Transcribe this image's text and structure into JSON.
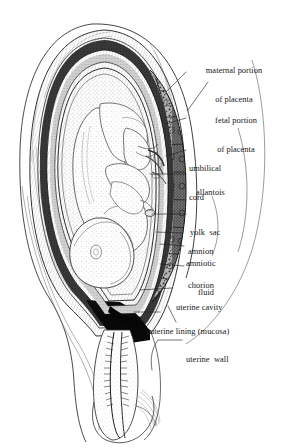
{
  "figure": {
    "background_color": "#ffffff",
    "ink_color": "#161616",
    "style": "stipple engraving, grayscale"
  },
  "labels": [
    {
      "id": "maternal-portion-of-placenta",
      "line1": "maternal portion",
      "line2": "of placenta"
    },
    {
      "id": "fetal-portion-of-placenta",
      "line1": "fetal portion",
      "line2": "of placenta"
    },
    {
      "id": "umbilical-cord",
      "line1": "umbilical",
      "line2": "cord"
    },
    {
      "id": "allantois",
      "line1": "allantois",
      "line2": ""
    },
    {
      "id": "yolk-sac",
      "line1": "yolk  sac",
      "line2": ""
    },
    {
      "id": "amnion",
      "line1": "amnion",
      "line2": ""
    },
    {
      "id": "amniotic-fluid",
      "line1": "amniotic",
      "line2": "fluid"
    },
    {
      "id": "chorion",
      "line1": "chorion",
      "line2": ""
    },
    {
      "id": "uterine-cavity",
      "line1": "uterine cavity",
      "line2": ""
    },
    {
      "id": "uterine-lining-mucosa",
      "line1": "uterine lining (mucosa)",
      "line2": ""
    },
    {
      "id": "uterine-wall",
      "line1": "uterine  wall",
      "line2": ""
    }
  ],
  "structures": [
    {
      "id": "uterus-outer-wall",
      "name": "uterine wall"
    },
    {
      "id": "uterine-mucosa",
      "name": "uterine lining (mucosa)"
    },
    {
      "id": "placenta-maternal",
      "name": "maternal portion of placenta"
    },
    {
      "id": "placenta-fetal",
      "name": "fetal portion of placenta"
    },
    {
      "id": "chorion-membrane",
      "name": "chorion"
    },
    {
      "id": "amnion-membrane",
      "name": "amnion"
    },
    {
      "id": "amniotic-cavity",
      "name": "amniotic fluid"
    },
    {
      "id": "fetus",
      "name": "fetus in vertex presentation"
    },
    {
      "id": "umbilical-cord-structure",
      "name": "umbilical cord"
    },
    {
      "id": "allantois-structure",
      "name": "allantois"
    },
    {
      "id": "yolk-sac-structure",
      "name": "yolk sac"
    },
    {
      "id": "cervical-canal",
      "name": "cervical canal"
    },
    {
      "id": "vagina",
      "name": "vaginal fornix"
    }
  ]
}
